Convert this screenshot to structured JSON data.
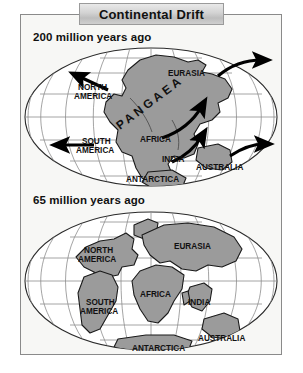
{
  "figure": {
    "title": "Continental Drift",
    "background_color": "#ffffff",
    "panel_color": "#f7f7f5",
    "border_color": "#8a8a8a",
    "land_color": "#9b9b9b",
    "land_outline_color": "#1a1a1a",
    "graticule_color": "#8d8d8d",
    "arrow_color": "#000000"
  },
  "panels": [
    {
      "id": "panel-200ma",
      "heading": "200 million years ago",
      "supercontinent_label": "PANGAEA",
      "labels": [
        "NORTH AMERICA",
        "EURASIA",
        "SOUTH AMERICA",
        "AFRICA",
        "INDIA",
        "AUSTRALIA",
        "ANTARCTICA"
      ],
      "label_lines": {
        "north_america": [
          "NORTH",
          "AMERICA"
        ],
        "eurasia": [
          "EURASIA"
        ],
        "south_america": [
          "SOUTH",
          "AMERICA"
        ],
        "africa": [
          "AFRICA"
        ],
        "india": [
          "INDIA"
        ],
        "australia": [
          "AUSTRALIA"
        ],
        "antarctica": [
          "ANTARCTICA"
        ]
      },
      "drift_arrows": [
        {
          "name": "north-america-arrow",
          "direction": "northwest"
        },
        {
          "name": "south-america-arrow",
          "direction": "west"
        },
        {
          "name": "eurasia-arrow",
          "direction": "northeast"
        },
        {
          "name": "africa-india-arrow",
          "direction": "northeast"
        },
        {
          "name": "india-arrow",
          "direction": "northeast"
        },
        {
          "name": "australia-arrow",
          "direction": "east"
        }
      ],
      "arrow_count": 6
    },
    {
      "id": "panel-65ma",
      "heading": "65 million years ago",
      "supercontinent_label": null,
      "labels": [
        "NORTH AMERICA",
        "EURASIA",
        "SOUTH AMERICA",
        "AFRICA",
        "INDIA",
        "AUSTRALIA",
        "ANTARCTICA"
      ],
      "label_lines": {
        "north_america": [
          "NORTH",
          "AMERICA"
        ],
        "eurasia": [
          "EURASIA"
        ],
        "south_america": [
          "SOUTH",
          "AMERICA"
        ],
        "africa": [
          "AFRICA"
        ],
        "india": [
          "INDIA"
        ],
        "australia": [
          "AUSTRALIA"
        ],
        "antarctica": [
          "ANTARCTICA"
        ]
      },
      "drift_arrows": [],
      "arrow_count": 0
    }
  ]
}
